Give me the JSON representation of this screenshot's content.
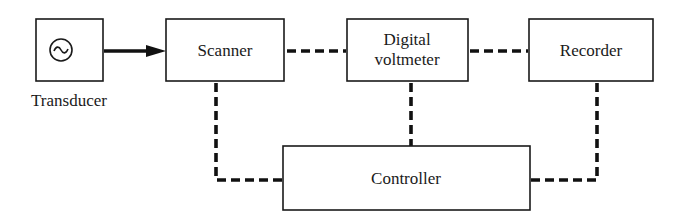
{
  "diagram": {
    "type": "block-diagram",
    "nodes": {
      "transducer": {
        "label": "Transducer",
        "icon": "ac-source-icon"
      },
      "scanner": {
        "label": "Scanner"
      },
      "voltmeter": {
        "label_line1": "Digital",
        "label_line2": "voltmeter"
      },
      "recorder": {
        "label": "Recorder"
      },
      "controller": {
        "label": "Controller"
      }
    },
    "edges": [
      {
        "from": "transducer",
        "to": "scanner",
        "style": "solid-arrow"
      },
      {
        "from": "scanner",
        "to": "voltmeter",
        "style": "dashed"
      },
      {
        "from": "voltmeter",
        "to": "recorder",
        "style": "dashed"
      },
      {
        "from": "scanner",
        "to": "controller",
        "style": "dashed"
      },
      {
        "from": "voltmeter",
        "to": "controller",
        "style": "dashed"
      },
      {
        "from": "recorder",
        "to": "controller",
        "style": "dashed"
      }
    ],
    "colors": {
      "ink": "#111111",
      "background": "#ffffff"
    }
  }
}
